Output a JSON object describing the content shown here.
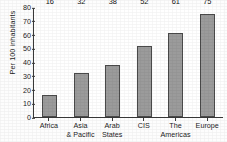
{
  "chart_data": {
    "type": "bar",
    "title": "",
    "xlabel": "",
    "ylabel": "Per 100 inhabitants",
    "categories": [
      "Africa",
      "Asia & Pacific",
      "Arab States",
      "CIS",
      "The Americas",
      "Europe"
    ],
    "category_lines": [
      [
        "Africa"
      ],
      [
        "Asia",
        "& Pacific"
      ],
      [
        "Arab",
        "States"
      ],
      [
        "CIS"
      ],
      [
        "The",
        "Americas"
      ],
      [
        "Europe"
      ]
    ],
    "values": [
      16,
      32,
      38,
      52,
      61,
      75
    ],
    "value_labels": [
      "16",
      "32",
      "38",
      "52",
      "61",
      "75"
    ],
    "ylim": [
      0,
      80
    ],
    "yticks": [
      80,
      70,
      60,
      50,
      40,
      30,
      20,
      10,
      0
    ],
    "ytick_labels": [
      "80",
      "70",
      "60",
      "50",
      "40",
      "30",
      "20",
      "10",
      "0"
    ],
    "grid": false,
    "legend": false,
    "legend_position": "none",
    "bar_fill_color": "#9b9b9b",
    "bar_edge_color": "#4a4a4a",
    "axis_color": "#3a3a3a",
    "background_color": "#ffffff",
    "text_color": "#1a1a1a"
  }
}
